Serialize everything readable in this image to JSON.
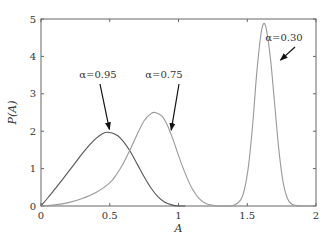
{
  "chart_data": {
    "type": "line",
    "title": "",
    "xlabel": "A",
    "ylabel": "P(A)",
    "xlim": [
      0,
      2
    ],
    "ylim": [
      0,
      5
    ],
    "grid": false,
    "xticks": [
      0,
      0.5,
      1,
      1.5,
      2
    ],
    "xtick_labels": [
      "0",
      "0.5",
      "1",
      "1.5",
      "2"
    ],
    "yticks": [
      0,
      1,
      2,
      3,
      4,
      5
    ],
    "ytick_labels": [
      "0",
      "1",
      "2",
      "3",
      "4",
      "5"
    ],
    "series": [
      {
        "name": "α=0.95",
        "color": "#555555",
        "x": [
          0,
          0.05,
          0.1,
          0.15,
          0.2,
          0.25,
          0.3,
          0.35,
          0.4,
          0.45,
          0.49,
          0.55,
          0.6,
          0.65,
          0.7,
          0.75,
          0.8,
          0.85,
          0.9,
          0.95,
          1.0,
          1.05
        ],
        "y": [
          0,
          0.22,
          0.45,
          0.68,
          0.92,
          1.16,
          1.4,
          1.62,
          1.81,
          1.94,
          1.97,
          1.9,
          1.72,
          1.45,
          1.12,
          0.78,
          0.48,
          0.25,
          0.1,
          0.03,
          0.0,
          0.0
        ]
      },
      {
        "name": "α=0.75",
        "color": "#999999",
        "x": [
          0,
          0.1,
          0.2,
          0.3,
          0.4,
          0.5,
          0.55,
          0.6,
          0.65,
          0.7,
          0.75,
          0.8,
          0.83,
          0.88,
          0.92,
          0.96,
          1.0,
          1.05,
          1.1,
          1.15,
          1.2,
          1.25,
          1.3,
          1.35
        ],
        "y": [
          0,
          0.03,
          0.09,
          0.2,
          0.36,
          0.62,
          0.85,
          1.15,
          1.52,
          1.92,
          2.28,
          2.47,
          2.5,
          2.4,
          2.15,
          1.78,
          1.35,
          0.86,
          0.46,
          0.2,
          0.07,
          0.02,
          0.0,
          0.0
        ]
      },
      {
        "name": "α=0.30",
        "color": "#999999",
        "x": [
          1.35,
          1.4,
          1.45,
          1.48,
          1.51,
          1.54,
          1.57,
          1.6,
          1.62,
          1.64,
          1.67,
          1.7,
          1.73,
          1.76,
          1.79,
          1.82,
          1.86,
          1.9,
          2.0
        ],
        "y": [
          0,
          0.02,
          0.15,
          0.45,
          1.1,
          2.2,
          3.6,
          4.6,
          4.88,
          4.7,
          3.9,
          2.7,
          1.5,
          0.65,
          0.22,
          0.06,
          0.01,
          0,
          0
        ]
      }
    ],
    "annotations": [
      {
        "text": "α=0.95",
        "points_to": [
          0.49,
          1.97
        ]
      },
      {
        "text": "α=0.75",
        "points_to": [
          0.94,
          1.95
        ]
      },
      {
        "text": "α=0.30",
        "points_to": [
          1.72,
          3.9
        ]
      }
    ]
  }
}
